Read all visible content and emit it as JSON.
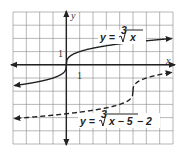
{
  "chart_data": {
    "type": "line",
    "title": "",
    "xlabel": "x",
    "ylabel": "y",
    "xlim": [
      -4,
      8
    ],
    "ylim": [
      -6,
      4
    ],
    "grid": true,
    "tick_labels": {
      "x_unit": "1",
      "y_unit": "1"
    },
    "series": [
      {
        "name": "y = ∛x",
        "style": "solid",
        "function": "cbrt(x)",
        "inflection": [
          0,
          0
        ]
      },
      {
        "name": "y = ∛(x − 5) − 2",
        "style": "dashed",
        "function": "cbrt(x-5)-2",
        "inflection": [
          5,
          -2
        ]
      }
    ]
  },
  "labels": {
    "x_axis": "x",
    "y_axis": "y",
    "x_tick": "1",
    "y_tick": "1",
    "eq1_prefix": "y = ",
    "eq1_index": "3",
    "eq1_radicand": "x",
    "eq2_prefix": "y = ",
    "eq2_index": "3",
    "eq2_radicand": "x − 5",
    "eq2_suffix": " − 2"
  }
}
